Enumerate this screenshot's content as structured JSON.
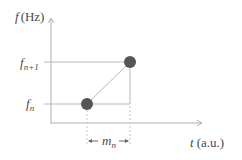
{
  "diagram": {
    "y_axis": {
      "label_var": "f",
      "label_unit": "(Hz)"
    },
    "x_axis": {
      "label_var": "t",
      "label_unit": "(a.u.)"
    },
    "ticks": {
      "upper": {
        "base": "f",
        "sub": "n+1"
      },
      "lower": {
        "base": "f",
        "sub": "n"
      }
    },
    "interval": {
      "base": "m",
      "sub": "n"
    },
    "points": [
      {
        "name": "f_n",
        "x": 87,
        "y": 104
      },
      {
        "name": "f_n+1",
        "x": 130,
        "y": 62
      }
    ],
    "colors": {
      "axis": "#a8a8a8",
      "point": "#555555",
      "text": "#4a4a4a"
    }
  }
}
